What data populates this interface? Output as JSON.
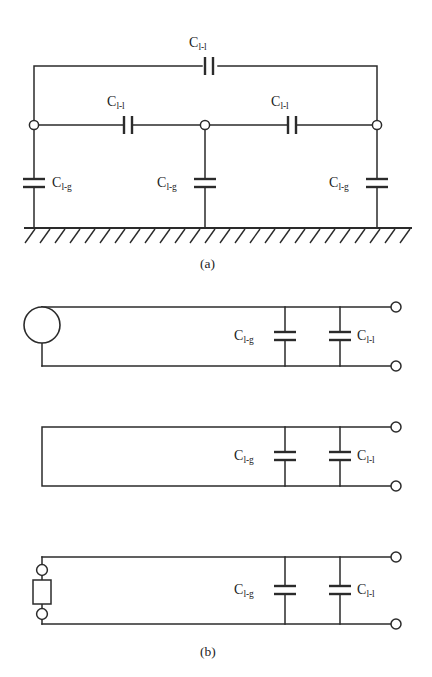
{
  "figure": {
    "background_color": "#ffffff",
    "line_color": "#2b2b2b",
    "width": 432,
    "height": 677
  },
  "labels": {
    "c_line_to_line": "C",
    "c_line_to_line_sub": "l-l",
    "c_line_to_ground": "C",
    "c_line_to_ground_sub": "l-g"
  },
  "captions": {
    "panel_a": "(a)",
    "panel_b": "(b)"
  },
  "panel_a": {
    "name": "distributed-capacitance-network",
    "description": "Three conductors above ground with line-to-line and line-to-ground capacitances",
    "top_capacitor": {
      "label": "C",
      "sublabel": "l-l",
      "label_x": 210,
      "label_y": 44,
      "orientation": "vertical-plates",
      "x": 210,
      "y": 66
    },
    "series_capacitors": [
      {
        "label": "C",
        "sublabel": "l-l",
        "label_x": 128,
        "label_y": 103,
        "x": 128,
        "y": 125
      },
      {
        "label": "C",
        "sublabel": "l-l",
        "label_x": 292,
        "label_y": 103,
        "x": 292,
        "y": 125
      }
    ],
    "shunt_capacitors": [
      {
        "label": "C",
        "sublabel": "l-g",
        "label_x": 50,
        "label_y": 177,
        "label_side": "right",
        "x": 34,
        "y": 183
      },
      {
        "label": "C",
        "sublabel": "l-g",
        "label_x": 162,
        "label_y": 177,
        "label_side": "left",
        "x": 205,
        "y": 183
      },
      {
        "label": "C",
        "sublabel": "l-g",
        "label_x": 332,
        "label_y": 177,
        "label_side": "left",
        "x": 377,
        "y": 183
      }
    ],
    "nodes": [
      {
        "x": 34,
        "y": 125
      },
      {
        "x": 205,
        "y": 125
      },
      {
        "x": 377,
        "y": 125
      }
    ],
    "ground": {
      "y": 228,
      "x_start": 24,
      "x_end": 412,
      "hatch_count": 26
    }
  },
  "panel_b": {
    "name": "equivalent-two-port-circuits",
    "circuits": [
      {
        "id": "source-terminated",
        "left_element": "voltage-source-circle",
        "top_rail_y": 307,
        "bottom_rail_y": 366,
        "shunt_capacitors": [
          {
            "label": "C",
            "sublabel": "l-g",
            "x": 285,
            "label_x": 237,
            "label_side": "left"
          },
          {
            "label": "C",
            "sublabel": "l-l",
            "x": 340,
            "label_x": 355,
            "label_side": "right"
          }
        ],
        "terminals": [
          {
            "x": 397,
            "y": 307
          },
          {
            "x": 397,
            "y": 366
          }
        ]
      },
      {
        "id": "short-circuited",
        "left_element": "short-circuit",
        "top_rail_y": 427,
        "bottom_rail_y": 486,
        "shunt_capacitors": [
          {
            "label": "C",
            "sublabel": "l-g",
            "x": 285,
            "label_x": 237,
            "label_side": "left"
          },
          {
            "label": "C",
            "sublabel": "l-l",
            "x": 340,
            "label_x": 355,
            "label_side": "right"
          }
        ],
        "terminals": [
          {
            "x": 397,
            "y": 427
          },
          {
            "x": 397,
            "y": 486
          }
        ]
      },
      {
        "id": "impedance-terminated",
        "left_element": "impedance-box-with-terminals",
        "top_rail_y": 557,
        "bottom_rail_y": 624,
        "shunt_capacitors": [
          {
            "label": "C",
            "sublabel": "l-g",
            "x": 285,
            "label_x": 237,
            "label_side": "left"
          },
          {
            "label": "C",
            "sublabel": "l-l",
            "x": 340,
            "label_x": 355,
            "label_side": "right"
          }
        ],
        "terminals": [
          {
            "x": 397,
            "y": 557
          },
          {
            "x": 397,
            "y": 624
          }
        ],
        "box": {
          "x": 42,
          "y": 580,
          "width": 20,
          "height": 24
        },
        "box_terminals": [
          {
            "x": 42,
            "y": 570
          },
          {
            "x": 42,
            "y": 614
          }
        ]
      }
    ]
  }
}
